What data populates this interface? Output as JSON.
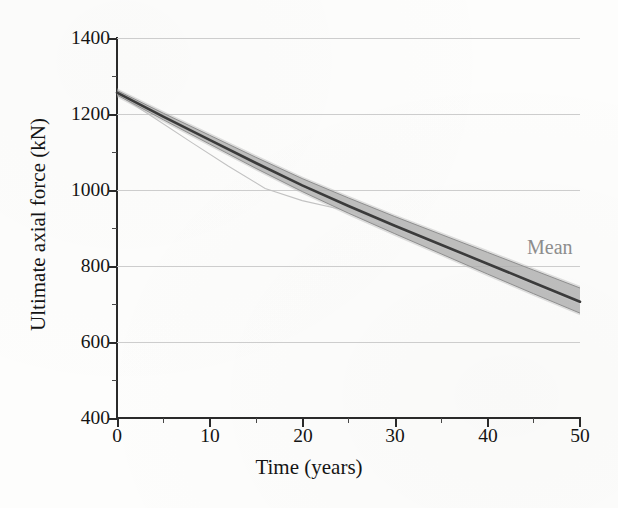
{
  "chart_data": {
    "type": "line",
    "title": "",
    "subtitle": "",
    "xlabel": "Time (years)",
    "ylabel": "Ultimate axial force (kN)",
    "xlim": [
      0,
      50
    ],
    "ylim": [
      400,
      1400
    ],
    "xticks": [
      0,
      10,
      20,
      30,
      40,
      50
    ],
    "xtick_labels": [
      "0",
      "10",
      "20",
      "30",
      "40",
      "50"
    ],
    "xminor_ticks": [
      5,
      15,
      25,
      35,
      45
    ],
    "yticks": [
      400,
      600,
      800,
      1000,
      1200,
      1400
    ],
    "ytick_labels": [
      "400",
      "600",
      "800",
      "1000",
      "1200",
      "1400"
    ],
    "yminor_ticks": [
      500,
      700,
      900,
      1100,
      1300
    ],
    "grid": true,
    "grid_axis": "y",
    "legend_position": "inside-right",
    "annotations": [
      {
        "text": "Mean",
        "x": 45.5,
        "y": 845,
        "color": "#8d8d8d"
      }
    ],
    "series": [
      {
        "name": "Mean",
        "style": "solid-dark",
        "color": "#3a3a3a",
        "x": [
          0,
          5,
          10,
          15,
          20,
          25,
          30,
          35,
          40,
          45,
          50
        ],
        "values": [
          1256,
          1193,
          1132,
          1071,
          1012,
          958,
          906,
          856,
          806,
          756,
          706
        ]
      },
      {
        "name": "Realizations band (upper envelope)",
        "style": "band-edge",
        "color": "#9a9a9a",
        "x": [
          0,
          5,
          10,
          15,
          20,
          25,
          30,
          35,
          40,
          45,
          50
        ],
        "values": [
          1262,
          1202,
          1144,
          1086,
          1030,
          979,
          930,
          883,
          836,
          789,
          742
        ]
      },
      {
        "name": "Realizations band (lower envelope)",
        "style": "band-edge",
        "color": "#9a9a9a",
        "x": [
          0,
          5,
          10,
          15,
          20,
          25,
          30,
          35,
          40,
          45,
          50
        ],
        "values": [
          1250,
          1185,
          1121,
          1057,
          996,
          939,
          885,
          832,
          779,
          727,
          676
        ]
      },
      {
        "name": "Outlier realization",
        "style": "thin-light",
        "color": "#bdbdbd",
        "x": [
          0,
          4,
          8,
          12,
          16,
          20,
          24,
          30,
          40,
          50
        ],
        "values": [
          1253,
          1190,
          1126,
          1063,
          1004,
          972,
          950,
          900,
          802,
          700
        ]
      }
    ],
    "band_description": "Monte-Carlo realization bundle of ultimate axial force degradation over 50 years; spread widens with time"
  },
  "axes": {
    "y_title": "Ultimate axial force (kN)",
    "x_title": "Time (years)",
    "y_tick_labels": [
      "1400",
      "1200",
      "1000",
      "800",
      "600",
      "400"
    ],
    "x_tick_labels": [
      "0",
      "10",
      "20",
      "30",
      "40",
      "50"
    ]
  },
  "annotations": {
    "mean": "Mean"
  },
  "colors": {
    "axis": "#2a2a2a",
    "grid": "#cdcdcd",
    "mean_line": "#3a3a3a",
    "band": "#9a9a9a",
    "annotation_text": "#8d8d8d",
    "background": "#fdfdfc"
  }
}
